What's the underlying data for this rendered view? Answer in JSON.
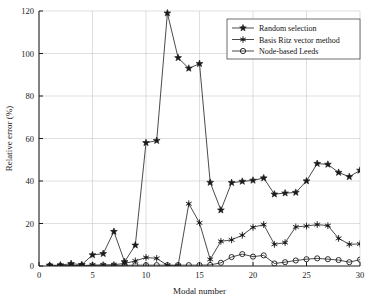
{
  "chart_data": {
    "type": "line",
    "title": "",
    "xlabel": "Modal number",
    "ylabel": "Relative error (%)",
    "xlim": [
      0,
      30
    ],
    "ylim": [
      0,
      120
    ],
    "xticks": [
      0,
      5,
      10,
      15,
      20,
      25,
      30
    ],
    "yticks": [
      0,
      20,
      40,
      60,
      80,
      100,
      120
    ],
    "grid": true,
    "legend_position": "top-right",
    "x": [
      1,
      2,
      3,
      4,
      5,
      6,
      7,
      8,
      9,
      10,
      11,
      12,
      13,
      14,
      15,
      16,
      17,
      18,
      19,
      20,
      21,
      22,
      23,
      24,
      25,
      26,
      27,
      28,
      29,
      30
    ],
    "series": [
      {
        "name": "Random selection",
        "marker": "star5",
        "color": "#1a1a1a",
        "values": [
          0.3,
          0.4,
          1.1,
          0.6,
          5.2,
          5.8,
          16.2,
          2.0,
          9.8,
          58.0,
          59.0,
          119.0,
          98.0,
          93.0,
          95.2,
          39.3,
          26.3,
          39.2,
          39.8,
          40.3,
          41.4,
          33.8,
          34.3,
          34.6,
          40.0,
          48.2,
          47.8,
          44.0,
          42.0,
          45.0
        ]
      },
      {
        "name": "Basis Ritz vector method",
        "marker": "asterisk",
        "color": "#1a1a1a",
        "values": [
          0.1,
          0.2,
          0.3,
          0.2,
          0.4,
          0.5,
          0.6,
          1.2,
          2.4,
          4.0,
          3.6,
          0.3,
          0.2,
          29.3,
          20.3,
          3.1,
          11.6,
          12.3,
          14.5,
          18.2,
          19.5,
          10.2,
          11.0,
          18.4,
          18.8,
          19.5,
          19.0,
          13.0,
          10.2,
          10.4
        ]
      },
      {
        "name": "Node-based Leeds",
        "marker": "circle",
        "color": "#1a1a1a",
        "values": [
          0.1,
          0.1,
          0.2,
          0.2,
          0.3,
          0.3,
          0.3,
          0.3,
          0.4,
          0.4,
          0.4,
          0.4,
          0.4,
          0.4,
          0.4,
          0.5,
          1.5,
          4.2,
          5.6,
          4.4,
          5.0,
          1.2,
          1.8,
          2.6,
          3.2,
          3.6,
          3.2,
          2.8,
          1.8,
          3.0
        ]
      }
    ]
  },
  "legend": {
    "entries": [
      {
        "label": "Random selection",
        "marker": "star5-icon"
      },
      {
        "label": "Basis Ritz vector method",
        "marker": "asterisk-icon"
      },
      {
        "label": "Node-based Leeds",
        "marker": "circle-icon"
      }
    ]
  }
}
